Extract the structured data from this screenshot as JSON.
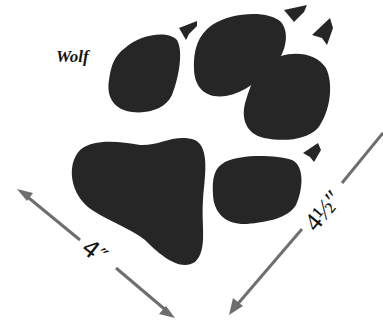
{
  "diagram": {
    "species_label": "Wolf",
    "measurements": {
      "width": "4″",
      "length": "4½″"
    },
    "colors": {
      "pad_fill": "#262626",
      "arrow": "#6e6e6e",
      "background": "#ffffff",
      "text": "#141414"
    },
    "parts": {
      "toes": 4,
      "claws": 4,
      "main_pad": 1
    }
  }
}
